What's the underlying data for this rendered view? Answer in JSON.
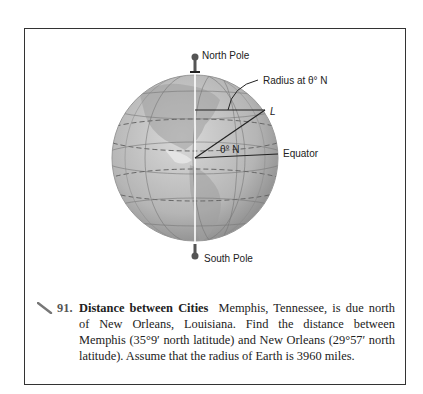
{
  "figure": {
    "labels": {
      "north_pole": "North Pole",
      "south_pole": "South Pole",
      "radius": "Radius at θ° N",
      "point": "L",
      "angle": "θ° N",
      "equator": "Equator"
    }
  },
  "problem": {
    "number": "91.",
    "title": "Distance between Cities",
    "text": "Memphis, Tennessee, is due north of New Orleans, Louisiana. Find the distance between Memphis (35°9′ north latitude) and New Orleans (29°57′ north latitude). Assume that the radius of Earth is 3960 miles."
  }
}
